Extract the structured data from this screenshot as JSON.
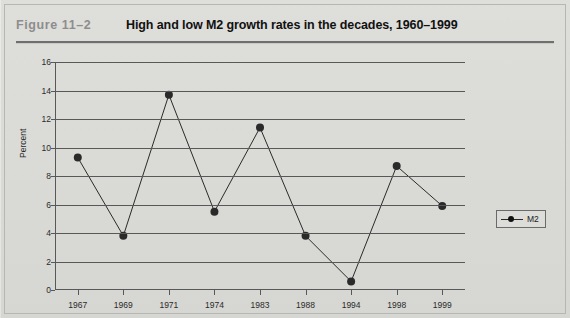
{
  "figure": {
    "label": "Figure  11–2",
    "title": "High and low M2 growth rates in the decades, 1960–1999"
  },
  "legend": {
    "entries": [
      {
        "name": "M2",
        "marker": "filled-circle",
        "color": "#111111"
      }
    ],
    "position": "right"
  },
  "colors": {
    "page_background": "#dcdcd8",
    "axis": "#585858",
    "series": "#2a2a2a",
    "title_text": "#111111",
    "figure_label_text": "#8d8d8d"
  },
  "chart_data": {
    "type": "line",
    "title": "High and low M2 growth rates in the decades, 1960–1999",
    "xlabel": "",
    "ylabel": "Percent",
    "categories": [
      "1967",
      "1969",
      "1971",
      "1974",
      "1983",
      "1988",
      "1994",
      "1998",
      "1999"
    ],
    "series": [
      {
        "name": "M2",
        "values": [
          9.3,
          3.8,
          13.7,
          5.5,
          11.4,
          3.8,
          0.6,
          8.7,
          5.9
        ]
      }
    ],
    "ylim": [
      0,
      16
    ],
    "yticks": [
      0,
      2,
      4,
      6,
      8,
      10,
      12,
      14,
      16
    ],
    "ytick_labels": [
      "0",
      "2",
      "4",
      "6",
      "8",
      "10",
      "12",
      "14",
      "16"
    ],
    "grid": "horizontal",
    "legend_position": "right",
    "markers": true
  }
}
